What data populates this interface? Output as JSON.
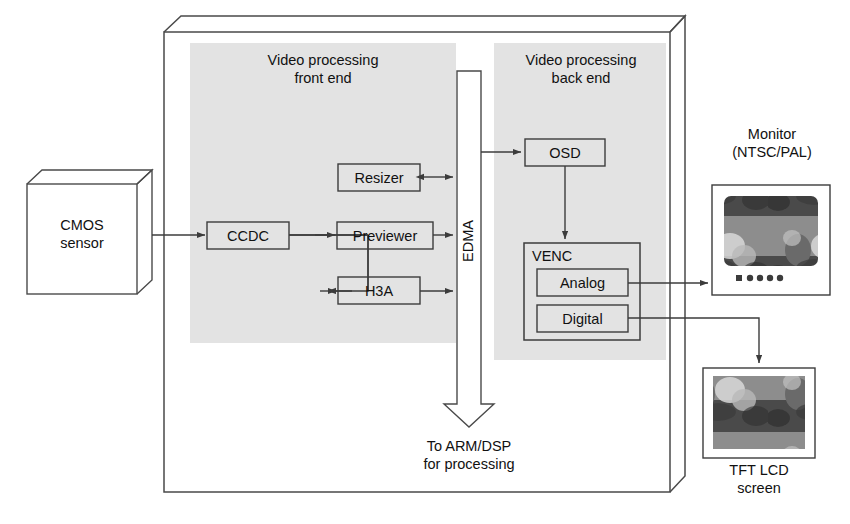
{
  "diagram": {
    "chip_regions": {
      "front_end_label": "Video processing\nfront end",
      "front_end_line1": "Video processing",
      "front_end_line2": "front end",
      "back_end_line1": "Video processing",
      "back_end_line2": "back end"
    },
    "blocks": [
      {
        "id": "cmos",
        "label_line1": "CMOS",
        "label_line2": "sensor",
        "shape": "3d-box"
      },
      {
        "id": "ccdc",
        "label": "CCDC",
        "shape": "rect"
      },
      {
        "id": "resizer",
        "label": "Resizer",
        "shape": "rect"
      },
      {
        "id": "previewer",
        "label": "Previewer",
        "shape": "rect"
      },
      {
        "id": "h3a",
        "label": "H3A",
        "shape": "rect"
      },
      {
        "id": "edma",
        "label": "EDMA",
        "shape": "down-arrow"
      },
      {
        "id": "osd",
        "label": "OSD",
        "shape": "rect"
      },
      {
        "id": "venc",
        "label": "VENC",
        "shape": "rect-group"
      },
      {
        "id": "analog",
        "label": "Analog",
        "shape": "rect"
      },
      {
        "id": "digital",
        "label": "Digital",
        "shape": "rect"
      },
      {
        "id": "monitor",
        "label_line1": "Monitor",
        "label_line2": "(NTSC/PAL)",
        "shape": "device"
      },
      {
        "id": "tftlcd",
        "label_line1": "TFT LCD",
        "label_line2": "screen",
        "shape": "device"
      }
    ],
    "labels": {
      "cmos_line1": "CMOS",
      "cmos_line2": "sensor",
      "ccdc": "CCDC",
      "resizer": "Resizer",
      "previewer": "Previewer",
      "h3a": "H3A",
      "edma": "EDMA",
      "osd": "OSD",
      "venc": "VENC",
      "analog": "Analog",
      "digital": "Digital",
      "monitor_line1": "Monitor",
      "monitor_line2": "(NTSC/PAL)",
      "tft_line1": "TFT LCD",
      "tft_line2": "screen",
      "edma_out_line1": "To ARM/DSP",
      "edma_out_line2": "for processing"
    },
    "connections": [
      {
        "from": "cmos",
        "to": "ccdc",
        "arrow": "single"
      },
      {
        "from": "ccdc",
        "to": "previewer",
        "arrow": "single"
      },
      {
        "from": "ccdc",
        "to": "h3a",
        "arrow": "single"
      },
      {
        "from": "resizer",
        "to": "edma",
        "arrow": "double"
      },
      {
        "from": "previewer",
        "to": "edma",
        "arrow": "single"
      },
      {
        "from": "h3a",
        "to": "edma",
        "arrow": "single"
      },
      {
        "from": "edma",
        "to": "osd",
        "arrow": "single"
      },
      {
        "from": "osd",
        "to": "venc",
        "arrow": "single"
      },
      {
        "from": "analog",
        "to": "monitor",
        "arrow": "single"
      },
      {
        "from": "digital",
        "to": "tftlcd",
        "arrow": "single"
      },
      {
        "from": "edma",
        "to": "arm_dsp",
        "arrow": "block-arrow-down"
      }
    ],
    "colors": {
      "stroke": "#3c3c3c",
      "panel_gray": "#e2e2e2",
      "background": "#ffffff",
      "text": "#111111",
      "screen_dark": "#6f6f6f"
    }
  }
}
